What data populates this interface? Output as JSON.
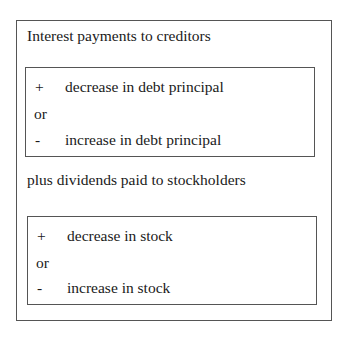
{
  "heading_1": "Interest payments to creditors",
  "box_1": {
    "row_1": {
      "sign": "+",
      "text": "decrease in debt principal"
    },
    "connector": "or",
    "row_2": {
      "sign": "-",
      "text": "increase in debt principal"
    }
  },
  "heading_2": "plus dividends paid to stockholders",
  "box_2": {
    "row_1": {
      "sign": "+",
      "text": "decrease in stock"
    },
    "connector": "or",
    "row_2": {
      "sign": "-",
      "text": "increase in stock"
    }
  }
}
